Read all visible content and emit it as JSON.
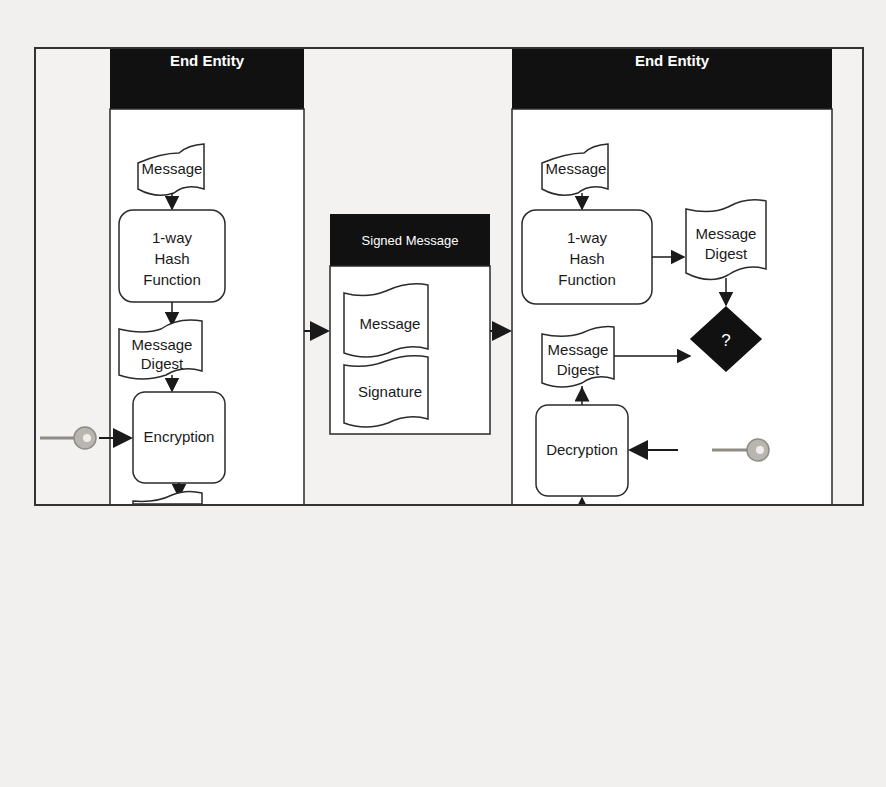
{
  "diagram": {
    "type": "digital-signature-flow",
    "sender": {
      "title": "End Entity",
      "nodes": [
        {
          "id": "s_message",
          "kind": "document",
          "label": "Message"
        },
        {
          "id": "s_hash",
          "kind": "process",
          "label_lines": [
            "1-way",
            "Hash",
            "Function"
          ]
        },
        {
          "id": "s_digest",
          "kind": "document",
          "label_lines": [
            "Message",
            "Digest"
          ]
        },
        {
          "id": "s_encrypt",
          "kind": "process",
          "label": "Encryption"
        },
        {
          "id": "s_signature",
          "kind": "document",
          "label": "Signature"
        }
      ],
      "key_icon": "key-icon"
    },
    "signed_message": {
      "title": "Signed Message",
      "parts": [
        {
          "id": "sm_message",
          "kind": "document",
          "label": "Message"
        },
        {
          "id": "sm_signature",
          "kind": "document",
          "label": "Signature"
        }
      ]
    },
    "receiver": {
      "title": "End Entity",
      "nodes": [
        {
          "id": "r_message",
          "kind": "document",
          "label": "Message"
        },
        {
          "id": "r_hash",
          "kind": "process",
          "label_lines": [
            "1-way",
            "Hash",
            "Function"
          ]
        },
        {
          "id": "r_digest_computed",
          "kind": "document",
          "label_lines": [
            "Message",
            "Digest"
          ]
        },
        {
          "id": "r_digest_decrypted",
          "kind": "document",
          "label_lines": [
            "Message",
            "Digest"
          ]
        },
        {
          "id": "r_compare",
          "kind": "decision",
          "label": "?"
        },
        {
          "id": "r_decrypt",
          "kind": "process",
          "label": "Decryption"
        },
        {
          "id": "r_signature",
          "kind": "document",
          "label": "Signature"
        }
      ],
      "key_icon": "key-icon"
    },
    "edges": [
      [
        "s_message",
        "s_hash"
      ],
      [
        "s_hash",
        "s_digest"
      ],
      [
        "s_digest",
        "s_encrypt"
      ],
      [
        "key",
        "s_encrypt"
      ],
      [
        "s_encrypt",
        "s_signature"
      ],
      [
        "sender",
        "signed_message"
      ],
      [
        "signed_message",
        "receiver"
      ],
      [
        "r_message",
        "r_hash"
      ],
      [
        "r_hash",
        "r_digest_computed"
      ],
      [
        "r_digest_computed",
        "r_compare"
      ],
      [
        "r_digest_decrypted",
        "r_compare"
      ],
      [
        "r_signature",
        "r_decrypt"
      ],
      [
        "key",
        "r_decrypt"
      ],
      [
        "r_decrypt",
        "r_digest_decrypted"
      ]
    ]
  },
  "colors": {
    "header_fill": "#111111",
    "stroke": "#2a2a2a",
    "box_fill": "#ffffff",
    "page_bg": "#f1f0ee",
    "key_fill": "#b9b6b0"
  }
}
